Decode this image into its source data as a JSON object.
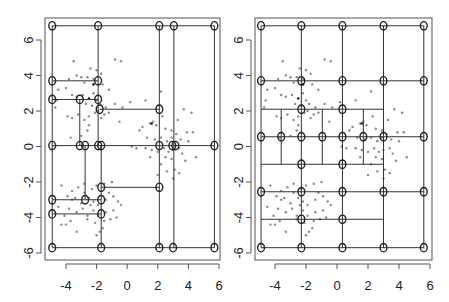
{
  "chart_data": [
    {
      "type": "scatter",
      "title": "",
      "xlabel": "",
      "ylabel": "",
      "xlim": [
        -5.2,
        6.1
      ],
      "ylim": [
        -6.3,
        7.3
      ],
      "x_ticks": [
        "-4",
        "-2",
        "0",
        "2",
        "4",
        "6"
      ],
      "y_ticks": [
        "-6",
        "-4",
        "-2",
        "0",
        "2",
        "4",
        "6"
      ],
      "grid": false,
      "legend": null,
      "description": "Adaptive (tree/quadtree-like) partition of 2D point data with nodes (circles) joined by horizontal and vertical segments",
      "nodes": [
        [
          -4.9,
          6.8
        ],
        [
          -1.9,
          6.8
        ],
        [
          2.1,
          6.8
        ],
        [
          3.05,
          6.8
        ],
        [
          5.7,
          6.8
        ],
        [
          -4.9,
          3.7
        ],
        [
          -1.9,
          3.7
        ],
        [
          -4.9,
          2.65
        ],
        [
          -3.1,
          2.65
        ],
        [
          -1.9,
          2.65
        ],
        [
          -1.8,
          2.1
        ],
        [
          2.1,
          2.1
        ],
        [
          -4.9,
          0.05
        ],
        [
          -3.1,
          0.05
        ],
        [
          -2.75,
          0.05
        ],
        [
          -1.9,
          0.05
        ],
        [
          -1.7,
          0.05
        ],
        [
          2.1,
          0.05
        ],
        [
          2.95,
          0.05
        ],
        [
          3.15,
          0.05
        ],
        [
          5.7,
          0.05
        ],
        [
          -1.7,
          -2.3
        ],
        [
          2.1,
          -2.3
        ],
        [
          -4.9,
          -3.0
        ],
        [
          -2.75,
          -3.0
        ],
        [
          -1.7,
          -3.0
        ],
        [
          -4.9,
          -3.8
        ],
        [
          -1.7,
          -3.8
        ],
        [
          -4.9,
          -5.7
        ],
        [
          -1.7,
          -5.7
        ],
        [
          2.1,
          -5.7
        ],
        [
          3.0,
          -5.7
        ],
        [
          5.7,
          -5.7
        ]
      ],
      "h_segments": [
        [
          -4.9,
          5.7,
          6.8
        ],
        [
          -4.9,
          -1.9,
          3.7
        ],
        [
          -4.9,
          -1.9,
          2.65
        ],
        [
          -1.8,
          2.1,
          2.1
        ],
        [
          -4.9,
          5.7,
          0.05
        ],
        [
          -1.7,
          2.1,
          -2.3
        ],
        [
          -4.9,
          -1.7,
          -3.0
        ],
        [
          -4.9,
          -1.7,
          -3.8
        ],
        [
          -4.9,
          5.7,
          -5.7
        ]
      ],
      "v_segments": [
        [
          -4.9,
          -5.7,
          6.8
        ],
        [
          -1.9,
          0.05,
          6.8
        ],
        [
          -1.7,
          -5.7,
          0.05
        ],
        [
          -3.1,
          0.05,
          2.65
        ],
        [
          -2.75,
          -3.0,
          0.05
        ],
        [
          2.1,
          -5.7,
          6.8
        ],
        [
          3.05,
          -5.7,
          6.8
        ],
        [
          5.7,
          -5.7,
          6.8
        ]
      ]
    },
    {
      "type": "scatter",
      "title": "",
      "xlabel": "",
      "ylabel": "",
      "xlim": [
        -5.2,
        6.1
      ],
      "ylim": [
        -6.3,
        7.3
      ],
      "x_ticks": [
        "-4",
        "-2",
        "0",
        "2",
        "4",
        "6"
      ],
      "y_ticks": [
        "-6",
        "-4",
        "-2",
        "0",
        "2",
        "4",
        "6"
      ],
      "grid": false,
      "legend": null,
      "description": "Regular grid partition (5 columns x 8 rows) with refined sub-cells in the middle band",
      "nodes": [
        [
          -4.9,
          6.8
        ],
        [
          -2.3,
          6.8
        ],
        [
          0.35,
          6.8
        ],
        [
          3.0,
          6.8
        ],
        [
          5.6,
          6.8
        ],
        [
          -4.9,
          3.7
        ],
        [
          -2.3,
          3.7
        ],
        [
          0.35,
          3.7
        ],
        [
          3.0,
          3.7
        ],
        [
          5.6,
          3.7
        ],
        [
          -2.3,
          2.1
        ],
        [
          0.35,
          2.1
        ],
        [
          -4.9,
          0.55
        ],
        [
          -3.6,
          0.55
        ],
        [
          -2.3,
          0.55
        ],
        [
          -0.95,
          0.55
        ],
        [
          0.35,
          0.55
        ],
        [
          1.7,
          0.55
        ],
        [
          3.0,
          0.55
        ],
        [
          5.6,
          0.55
        ],
        [
          -2.3,
          -1.0
        ],
        [
          0.35,
          -1.0
        ],
        [
          -4.9,
          -2.55
        ],
        [
          -2.3,
          -2.55
        ],
        [
          0.35,
          -2.55
        ],
        [
          3.0,
          -2.55
        ],
        [
          5.6,
          -2.55
        ],
        [
          -2.3,
          -4.1
        ],
        [
          0.35,
          -4.1
        ],
        [
          -4.9,
          -5.7
        ],
        [
          -2.3,
          -5.7
        ],
        [
          0.35,
          -5.7
        ],
        [
          3.0,
          -5.7
        ],
        [
          5.6,
          -5.7
        ]
      ],
      "h_segments": [
        [
          -4.9,
          5.6,
          6.8
        ],
        [
          -4.9,
          5.6,
          3.7
        ],
        [
          -4.9,
          3.0,
          2.1
        ],
        [
          -4.9,
          5.6,
          0.55
        ],
        [
          -4.9,
          3.0,
          -1.0
        ],
        [
          -4.9,
          5.6,
          -2.55
        ],
        [
          -4.9,
          3.0,
          -4.1
        ],
        [
          -4.9,
          5.6,
          -5.7
        ]
      ],
      "v_segments": [
        [
          -4.9,
          -5.7,
          6.8
        ],
        [
          -2.3,
          -5.7,
          6.8
        ],
        [
          0.35,
          -5.7,
          6.8
        ],
        [
          3.0,
          -5.7,
          6.8
        ],
        [
          5.6,
          -5.7,
          6.8
        ],
        [
          -3.6,
          -1.0,
          2.1
        ],
        [
          -0.95,
          -1.0,
          2.1
        ],
        [
          1.7,
          -1.0,
          2.1
        ]
      ]
    }
  ],
  "points_style": {
    "color": "#8a8a8a",
    "node_color": "#222222",
    "line_color": "#333333"
  },
  "points": [
    [
      -3.5,
      4.8
    ],
    [
      -3.3,
      4.0
    ],
    [
      -3.0,
      3.9
    ],
    [
      -2.6,
      3.9
    ],
    [
      -2.2,
      3.8
    ],
    [
      -2.0,
      4.3
    ],
    [
      -1.7,
      4.1
    ],
    [
      -0.8,
      4.9
    ],
    [
      -0.4,
      4.8
    ],
    [
      -2.4,
      4.4
    ],
    [
      -3.8,
      3.8
    ],
    [
      -4.0,
      3.3
    ],
    [
      -4.5,
      3.2
    ],
    [
      -2.8,
      3.6
    ],
    [
      -1.6,
      3.5
    ],
    [
      -1.2,
      3.2
    ],
    [
      -3.6,
      2.9
    ],
    [
      -3.3,
      2.8
    ],
    [
      -2.9,
      2.9
    ],
    [
      -2.2,
      3.0
    ],
    [
      -2.7,
      2.4
    ],
    [
      -2.3,
      2.3
    ],
    [
      -2.0,
      2.6
    ],
    [
      -1.8,
      2.4
    ],
    [
      -1.4,
      2.2
    ],
    [
      -0.8,
      2.4
    ],
    [
      -0.3,
      2.2
    ],
    [
      0.2,
      2.5
    ],
    [
      -3.9,
      1.7
    ],
    [
      -3.6,
      1.6
    ],
    [
      -3.2,
      1.8
    ],
    [
      -2.8,
      1.5
    ],
    [
      -2.5,
      1.7
    ],
    [
      -2.1,
      1.9
    ],
    [
      -1.7,
      1.6
    ],
    [
      -1.2,
      1.9
    ],
    [
      -3.7,
      0.5
    ],
    [
      -3.0,
      0.6
    ],
    [
      -2.6,
      0.9
    ],
    [
      -0.5,
      1.4
    ],
    [
      -4.7,
      2.2
    ],
    [
      -4.6,
      2.6
    ],
    [
      -2.5,
      1.2
    ],
    [
      -1.9,
      2.0
    ],
    [
      -1.5,
      1.8
    ],
    [
      1.2,
      2.6
    ],
    [
      2.2,
      3.1
    ],
    [
      2.3,
      1.7
    ],
    [
      1.5,
      1.3
    ],
    [
      1.9,
      1.2
    ],
    [
      2.5,
      1.0
    ],
    [
      2.9,
      0.9
    ],
    [
      3.3,
      1.5
    ],
    [
      3.7,
      2.1
    ],
    [
      4.2,
      1.9
    ],
    [
      1.0,
      1.1
    ],
    [
      0.8,
      0.9
    ],
    [
      1.3,
      0.5
    ],
    [
      1.8,
      0.4
    ],
    [
      2.2,
      0.5
    ],
    [
      2.6,
      0.3
    ],
    [
      2.9,
      0.5
    ],
    [
      3.2,
      0.7
    ],
    [
      3.5,
      0.4
    ],
    [
      3.9,
      0.8
    ],
    [
      4.3,
      0.8
    ],
    [
      4.0,
      0.3
    ],
    [
      3.4,
      -0.1
    ],
    [
      3.0,
      -0.2
    ],
    [
      2.7,
      -0.3
    ],
    [
      2.4,
      -0.1
    ],
    [
      2.0,
      -0.3
    ],
    [
      1.6,
      -0.2
    ],
    [
      1.2,
      -0.1
    ],
    [
      0.6,
      -0.1
    ],
    [
      0.3,
      0.0
    ],
    [
      3.6,
      -0.4
    ],
    [
      2.9,
      -0.7
    ],
    [
      2.5,
      -0.6
    ],
    [
      2.2,
      -1.0
    ],
    [
      2.6,
      -1.4
    ],
    [
      3.1,
      -1.3
    ],
    [
      3.4,
      -1.5
    ],
    [
      3.0,
      -1.8
    ],
    [
      2.0,
      -1.6
    ],
    [
      1.5,
      -0.6
    ],
    [
      3.8,
      -0.8
    ],
    [
      4.5,
      -0.6
    ],
    [
      1.7,
      1.4
    ],
    [
      -4.3,
      -2.2
    ],
    [
      -3.6,
      -2.5
    ],
    [
      -3.2,
      -2.3
    ],
    [
      -2.8,
      -2.1
    ],
    [
      -2.3,
      -2.4
    ],
    [
      -2.0,
      -2.2
    ],
    [
      -1.5,
      -2.1
    ],
    [
      -1.0,
      -2.0
    ],
    [
      -3.9,
      -2.8
    ],
    [
      -3.4,
      -2.9
    ],
    [
      -3.0,
      -3.2
    ],
    [
      -2.5,
      -2.9
    ],
    [
      -2.2,
      -3.1
    ],
    [
      -1.9,
      -3.3
    ],
    [
      -1.4,
      -3.0
    ],
    [
      -0.9,
      -2.8
    ],
    [
      -0.6,
      -3.1
    ],
    [
      -4.5,
      -3.4
    ],
    [
      -3.8,
      -3.5
    ],
    [
      -3.3,
      -3.7
    ],
    [
      -2.9,
      -3.5
    ],
    [
      -2.6,
      -3.9
    ],
    [
      -2.2,
      -3.6
    ],
    [
      -1.9,
      -3.9
    ],
    [
      -1.4,
      -3.7
    ],
    [
      -0.9,
      -3.6
    ],
    [
      -0.7,
      -4.0
    ],
    [
      -4.3,
      -4.4
    ],
    [
      -4.0,
      -4.4
    ],
    [
      -3.7,
      -4.2
    ],
    [
      -2.6,
      -4.1
    ],
    [
      -2.1,
      -4.3
    ],
    [
      -1.5,
      -4.2
    ],
    [
      -1.1,
      -4.1
    ],
    [
      -1.6,
      -4.6
    ],
    [
      -3.3,
      -4.8
    ],
    [
      -2.0,
      -5.0
    ],
    [
      -1.8,
      -4.8
    ],
    [
      -2.8,
      -2.6
    ],
    [
      -1.2,
      -2.6
    ],
    [
      -3.6,
      -3.0
    ],
    [
      -2.4,
      -3.3
    ],
    [
      -4.1,
      -3.9
    ],
    [
      -0.4,
      -3.3
    ]
  ],
  "dark_points": [
    [
      1.6,
      1.3
    ],
    [
      -2.5,
      2.7
    ],
    [
      -2.2,
      3.5
    ]
  ]
}
